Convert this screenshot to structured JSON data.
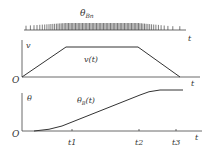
{
  "figure": {
    "pulse_panel": {
      "label": "θ",
      "label_sub": "Bn",
      "axis_label": "t"
    },
    "velocity_panel": {
      "y_axis_label": "v",
      "origin_label": "O",
      "x_axis_label": "t",
      "curve_label": "v(t)"
    },
    "angle_panel": {
      "y_axis_label": "θ",
      "origin_label": "O",
      "x_axis_label": "t",
      "curve_label_main": "θ",
      "curve_label_sub": "B",
      "curve_label_arg": "(t)",
      "ticks": [
        "t1",
        "t2",
        "t3"
      ]
    }
  },
  "chart_data": [
    {
      "type": "line",
      "title": "Pulse train θBn",
      "description": "Pulse train: sparse at start, dense in middle (constant speed), sparse at end",
      "xlabel": "t"
    },
    {
      "type": "line",
      "title": "v(t)",
      "xlabel": "t",
      "ylabel": "v",
      "x": [
        0,
        1,
        2.4,
        3.2
      ],
      "y": [
        0,
        1,
        1,
        0
      ],
      "description": "Trapezoidal velocity profile: accelerate, constant, decelerate"
    },
    {
      "type": "line",
      "title": "θB(t)",
      "xlabel": "t",
      "ylabel": "θ",
      "x_ticks": [
        "t1",
        "t2",
        "t3"
      ],
      "description": "S-shaped position curve, rising and leveling off after t2"
    }
  ]
}
